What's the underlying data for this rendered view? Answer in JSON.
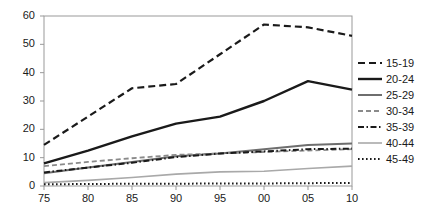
{
  "chart_data": {
    "type": "line",
    "title": "",
    "xlabel": "",
    "ylabel": "",
    "x": [
      "75",
      "80",
      "85",
      "90",
      "95",
      "00",
      "05",
      "10"
    ],
    "categories": [
      "75",
      "80",
      "85",
      "90",
      "95",
      "00",
      "05",
      "10"
    ],
    "xlim": [
      0,
      7
    ],
    "ylim": [
      0,
      60
    ],
    "yticks": [
      "0",
      "10",
      "20",
      "30",
      "40",
      "50",
      "60"
    ],
    "ytick_values": [
      0,
      10,
      20,
      30,
      40,
      50,
      60
    ],
    "grid": false,
    "legend_position": "right",
    "series": [
      {
        "name": "15-19",
        "values": [
          14.5,
          24.5,
          34.5,
          36.0,
          46.5,
          57.0,
          56.0,
          53.0
        ],
        "style": "dashed",
        "color": "#1a1a1a",
        "width": 2.2
      },
      {
        "name": "20-24",
        "values": [
          8.0,
          12.5,
          17.5,
          22.0,
          24.5,
          30.0,
          37.0,
          34.0
        ],
        "style": "solid",
        "color": "#1a1a1a",
        "width": 2.4
      },
      {
        "name": "25-29",
        "values": [
          4.5,
          6.5,
          8.5,
          10.5,
          11.5,
          13.0,
          14.5,
          15.0
        ],
        "style": "solid",
        "color": "#6e6e6e",
        "width": 2.0
      },
      {
        "name": "30-34",
        "values": [
          7.0,
          8.5,
          9.8,
          11.0,
          11.5,
          12.0,
          12.5,
          13.0
        ],
        "style": "dashed-light",
        "color": "#8a8a8a",
        "width": 1.8
      },
      {
        "name": "35-39",
        "values": [
          4.8,
          6.5,
          8.2,
          10.2,
          11.5,
          12.2,
          13.0,
          13.2
        ],
        "style": "dash-dot",
        "color": "#1a1a1a",
        "width": 2.0
      },
      {
        "name": "40-44",
        "values": [
          1.2,
          2.0,
          3.0,
          4.2,
          5.0,
          5.2,
          6.2,
          7.0
        ],
        "style": "solid-thin",
        "color": "#a9a9a9",
        "width": 1.6
      },
      {
        "name": "45-49",
        "values": [
          0.6,
          0.7,
          0.8,
          0.8,
          0.9,
          0.9,
          1.0,
          1.1
        ],
        "style": "dotted",
        "color": "#1a1a1a",
        "width": 2.0
      }
    ]
  },
  "legend": {
    "items": [
      {
        "label": "15-19"
      },
      {
        "label": "20-24"
      },
      {
        "label": "25-29"
      },
      {
        "label": "30-34"
      },
      {
        "label": "35-39"
      },
      {
        "label": "40-44"
      },
      {
        "label": "45-49"
      }
    ]
  },
  "axes": {
    "y_labels": [
      "60",
      "50",
      "40",
      "30",
      "20",
      "10",
      "0"
    ],
    "x_labels": [
      "75",
      "80",
      "85",
      "90",
      "95",
      "00",
      "05",
      "10"
    ]
  },
  "colors": {
    "axis": "#999999",
    "text": "#1a1a1a",
    "plot_background": "#ffffff"
  }
}
